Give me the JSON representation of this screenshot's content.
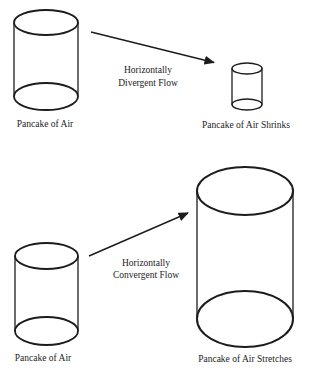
{
  "page": {
    "background_color": "#ffffff",
    "ink_color": "#1c1c1c"
  },
  "divergent_section": {
    "source_cylinder_label": "Pancake of Air",
    "flow_label": {
      "line1": "Horizontally",
      "line2": "Divergent Flow"
    },
    "result_cylinder_label": "Pancake of Air Shrinks"
  },
  "convergent_section": {
    "source_cylinder_label": "Pancake of Air",
    "flow_label": {
      "line1": "Horizontally",
      "line2": "Convergent Flow"
    },
    "result_cylinder_label": "Pancake of Air Stretches"
  }
}
